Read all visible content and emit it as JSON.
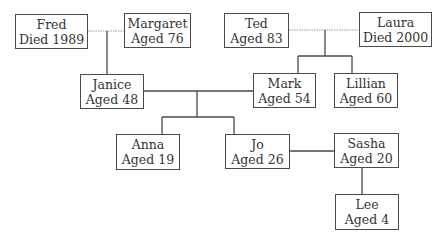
{
  "colors": {
    "line": "#4a4a4a",
    "marriage_line": "#9a9a9a",
    "box_border": "#4a4a4a",
    "text": "#333333"
  },
  "people": {
    "fred": {
      "name": "Fred",
      "status": "Died 1989"
    },
    "margaret": {
      "name": "Margaret",
      "status": "Aged 76"
    },
    "ted": {
      "name": "Ted",
      "status": "Aged 83"
    },
    "laura": {
      "name": "Laura",
      "status": "Died 2000"
    },
    "janice": {
      "name": "Janice",
      "status": "Aged 48"
    },
    "mark": {
      "name": "Mark",
      "status": "Aged 54"
    },
    "lillian": {
      "name": "Lillian",
      "status": "Aged 60"
    },
    "anna": {
      "name": "Anna",
      "status": "Aged 19"
    },
    "jo": {
      "name": "Jo",
      "status": "Aged 26"
    },
    "sasha": {
      "name": "Sasha",
      "status": "Aged 20"
    },
    "lee": {
      "name": "Lee",
      "status": "Aged 4"
    }
  },
  "relationships": [
    {
      "type": "former-marriage",
      "between": [
        "fred",
        "margaret"
      ],
      "children": [
        "janice"
      ]
    },
    {
      "type": "former-marriage",
      "between": [
        "ted",
        "laura"
      ],
      "children": [
        "mark",
        "lillian"
      ]
    },
    {
      "type": "marriage",
      "between": [
        "janice",
        "mark"
      ],
      "children": [
        "anna",
        "jo"
      ]
    },
    {
      "type": "partnership",
      "between": [
        "jo",
        "sasha"
      ]
    },
    {
      "type": "parent-child",
      "between": [
        "sasha",
        "lee"
      ]
    }
  ]
}
